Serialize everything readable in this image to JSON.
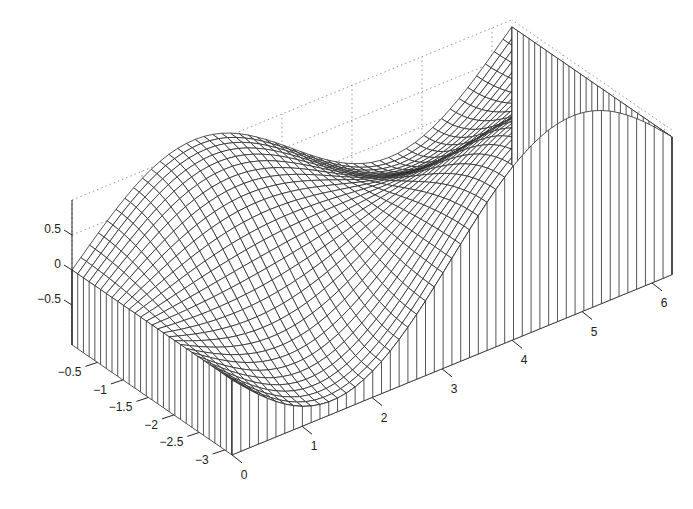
{
  "chart_data": {
    "type": "surface",
    "title": "",
    "xlabel": "",
    "ylabel": "",
    "zlabel": "",
    "x_range": [
      0,
      6.2832
    ],
    "y_range": [
      -3.1416,
      0
    ],
    "z_range": [
      -1,
      1
    ],
    "function_estimate": "z ≈ sin(x)·cos(y) + 0.9·(1 − cos(x/2))/2",
    "mesh_resolution": {
      "nx": 50,
      "ny": 28
    },
    "x_ticks": [
      0,
      1,
      2,
      3,
      4,
      5,
      6
    ],
    "x_tick_labels": [
      "0",
      "1",
      "2",
      "3",
      "4",
      "5",
      "6"
    ],
    "y_ticks": [
      -3,
      -2.5,
      -2,
      -1.5,
      -1,
      -0.5
    ],
    "y_tick_labels": [
      "−3",
      "−2.5",
      "−2",
      "−1.5",
      "−1",
      "−0.5"
    ],
    "z_ticks": [
      -0.5,
      0,
      0.5
    ],
    "z_tick_labels": [
      "−0.5",
      "0",
      "0.5"
    ],
    "edge_profiles": {
      "y_0_edge": [
        [
          0,
          0
        ],
        [
          1.57,
          1.1
        ],
        [
          3.14,
          0.45
        ],
        [
          4.71,
          -0.3
        ],
        [
          6.28,
          0.9
        ]
      ],
      "y_minus_pi_edge": [
        [
          0,
          0
        ],
        [
          1.2,
          -0.85
        ],
        [
          3.14,
          0.45
        ],
        [
          4.71,
          1.3
        ],
        [
          6.28,
          0.9
        ]
      ],
      "x_0_edge": "z = 0"
    },
    "grid": true,
    "style": "mesh with curtain (meshz), black on white",
    "colors": {
      "mesh": "#2a2a2a",
      "grid": "#999999",
      "background": "#ffffff"
    }
  }
}
